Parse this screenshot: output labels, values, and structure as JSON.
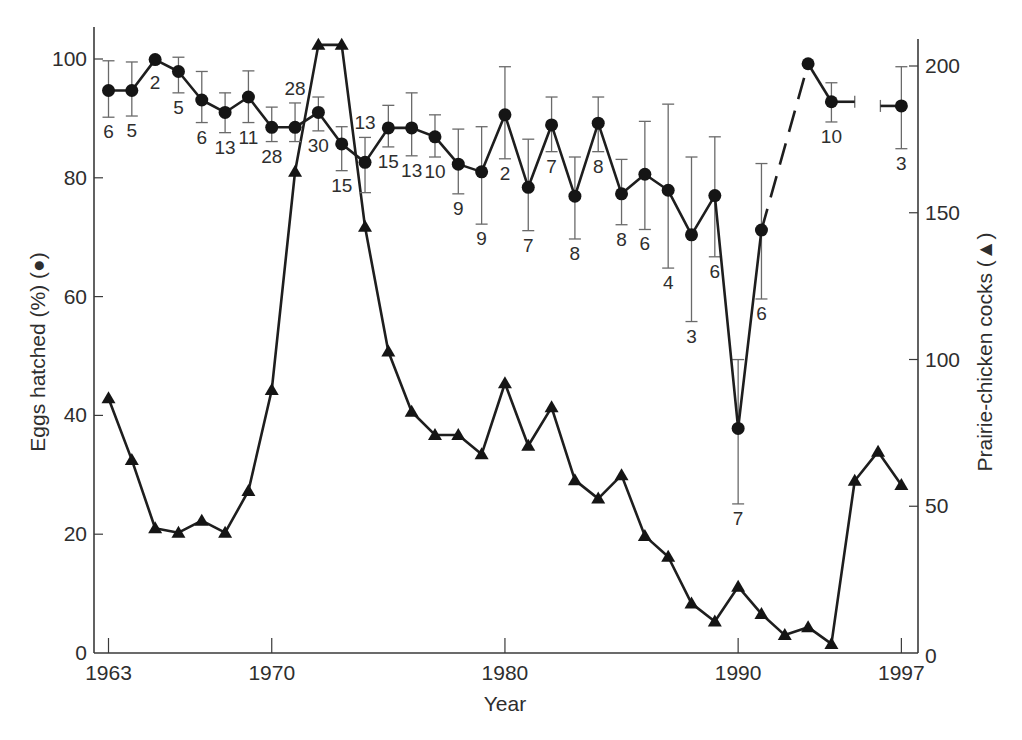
{
  "axes": {
    "xlabel": "Year",
    "ylabel_left": "Eggs hatched (%) (●)",
    "ylabel_right": "Prairie-chicken cocks (▲)"
  },
  "chart_data": {
    "type": "line",
    "title": "",
    "xlabel": "Year",
    "ylabel_left": "Eggs hatched (%) (●)",
    "ylabel_right": "Prairie-chicken cocks (▲)",
    "x_ticks": [
      1963,
      1970,
      1980,
      1990,
      1997
    ],
    "y_left_ticks": [
      0,
      20,
      40,
      60,
      80,
      100
    ],
    "y_right_ticks": [
      0,
      50,
      100,
      150,
      200
    ],
    "xlim": [
      1962.4,
      1997.7
    ],
    "ylim_left": [
      0,
      105
    ],
    "ylim_right": [
      0,
      209
    ],
    "grid": false,
    "legend": "none (markers identified in axis labels)",
    "series": [
      {
        "name": "Eggs hatched (%)",
        "marker": "circle",
        "axis": "left",
        "note": "error bars with sample size n labelled; 1992 missing (dashed connector 1991-1993)",
        "points": [
          {
            "x": 1963,
            "y": 94.7,
            "lo": 90.2,
            "hi": 99.7,
            "n": "6",
            "pos": "below"
          },
          {
            "x": 1964,
            "y": 94.7,
            "lo": 90.4,
            "hi": 99.5,
            "n": "5",
            "pos": "below"
          },
          {
            "x": 1965,
            "y": 99.9,
            "lo": null,
            "hi": null,
            "n": "2",
            "pos": "below"
          },
          {
            "x": 1966,
            "y": 97.9,
            "lo": 94.3,
            "hi": 100.3,
            "n": "5",
            "pos": "below"
          },
          {
            "x": 1967,
            "y": 93.1,
            "lo": 89.3,
            "hi": 97.9,
            "n": "6",
            "pos": "below"
          },
          {
            "x": 1968,
            "y": 91.0,
            "lo": 87.6,
            "hi": 94.3,
            "n": "13",
            "pos": "below"
          },
          {
            "x": 1969,
            "y": 93.6,
            "lo": 89.3,
            "hi": 98.0,
            "n": "11",
            "pos": "below"
          },
          {
            "x": 1970,
            "y": 88.5,
            "lo": 86.1,
            "hi": 91.9,
            "n": "28",
            "pos": "below"
          },
          {
            "x": 1971,
            "y": 88.5,
            "lo": 86.1,
            "hi": 92.6,
            "n": "28",
            "pos": "above"
          },
          {
            "x": 1972,
            "y": 91.0,
            "lo": 87.9,
            "hi": 93.6,
            "n": "30",
            "pos": "below"
          },
          {
            "x": 1973,
            "y": 85.7,
            "lo": 81.2,
            "hi": 88.6,
            "n": "15",
            "pos": "below"
          },
          {
            "x": 1974,
            "y": 82.6,
            "lo": 77.5,
            "hi": 86.8,
            "n": "13",
            "pos": "above"
          },
          {
            "x": 1975,
            "y": 88.4,
            "lo": 85.2,
            "hi": 92.2,
            "n": "15",
            "pos": "below"
          },
          {
            "x": 1976,
            "y": 88.4,
            "lo": 83.7,
            "hi": 94.3,
            "n": "13",
            "pos": "below"
          },
          {
            "x": 1977,
            "y": 86.9,
            "lo": 83.5,
            "hi": 90.6,
            "n": "10",
            "pos": "below"
          },
          {
            "x": 1978,
            "y": 82.3,
            "lo": 77.3,
            "hi": 88.2,
            "n": "9",
            "pos": "below"
          },
          {
            "x": 1979,
            "y": 81.0,
            "lo": 72.2,
            "hi": 88.6,
            "n": "9",
            "pos": "below"
          },
          {
            "x": 1980,
            "y": 90.6,
            "lo": 83.2,
            "hi": 98.7,
            "n": "2",
            "pos": "below"
          },
          {
            "x": 1981,
            "y": 78.4,
            "lo": 71.1,
            "hi": 86.5,
            "n": "7",
            "pos": "below"
          },
          {
            "x": 1982,
            "y": 88.9,
            "lo": 84.4,
            "hi": 93.6,
            "n": "7",
            "pos": "below"
          },
          {
            "x": 1983,
            "y": 76.9,
            "lo": 69.7,
            "hi": 83.5,
            "n": "8",
            "pos": "below"
          },
          {
            "x": 1984,
            "y": 89.2,
            "lo": 84.4,
            "hi": 93.6,
            "n": "8",
            "pos": "below"
          },
          {
            "x": 1985,
            "y": 77.3,
            "lo": 72.1,
            "hi": 83.1,
            "n": "8",
            "pos": "below"
          },
          {
            "x": 1986,
            "y": 80.6,
            "lo": 71.3,
            "hi": 89.5,
            "n": "6",
            "pos": "below"
          },
          {
            "x": 1987,
            "y": 77.9,
            "lo": 64.8,
            "hi": 92.4,
            "n": "4",
            "pos": "below"
          },
          {
            "x": 1988,
            "y": 70.4,
            "lo": 55.8,
            "hi": 83.5,
            "n": "3",
            "pos": "below"
          },
          {
            "x": 1989,
            "y": 77.0,
            "lo": 66.7,
            "hi": 86.9,
            "n": "6",
            "pos": "below"
          },
          {
            "x": 1990,
            "y": 37.8,
            "lo": 25.1,
            "hi": 49.4,
            "n": "7",
            "pos": "below"
          },
          {
            "x": 1991,
            "y": 71.2,
            "lo": 59.6,
            "hi": 82.4,
            "n": "6",
            "pos": "below"
          },
          {
            "x": 1993,
            "y": 99.2,
            "lo": null,
            "hi": null,
            "n": "",
            "pos": "below"
          },
          {
            "x": 1994,
            "y": 92.8,
            "lo": 89.4,
            "hi": 96.0,
            "n": "10",
            "pos": "below",
            "hbar_to": 1995.0
          },
          {
            "x": 1997,
            "y": 92.1,
            "lo": 84.9,
            "hi": 98.7,
            "n": "3",
            "pos": "below",
            "hbar_to": 1996.1
          }
        ],
        "dashed_segments": [
          [
            1991,
            1993
          ]
        ]
      },
      {
        "name": "Prairie-chicken cocks",
        "marker": "triangle",
        "axis": "right",
        "points": [
          {
            "x": 1963,
            "y": 86.8
          },
          {
            "x": 1964,
            "y": 65.8
          },
          {
            "x": 1965,
            "y": 42.5
          },
          {
            "x": 1966,
            "y": 41.0
          },
          {
            "x": 1967,
            "y": 45.1
          },
          {
            "x": 1968,
            "y": 41.0
          },
          {
            "x": 1969,
            "y": 55.2
          },
          {
            "x": 1970,
            "y": 89.6
          },
          {
            "x": 1971,
            "y": 164.0
          },
          {
            "x": 1972,
            "y": 207.2
          },
          {
            "x": 1973,
            "y": 207.2
          },
          {
            "x": 1974,
            "y": 145.2
          },
          {
            "x": 1975,
            "y": 102.7
          },
          {
            "x": 1976,
            "y": 82.2
          },
          {
            "x": 1977,
            "y": 74.3
          },
          {
            "x": 1978,
            "y": 74.3
          },
          {
            "x": 1979,
            "y": 67.7
          },
          {
            "x": 1980,
            "y": 91.9
          },
          {
            "x": 1981,
            "y": 70.6
          },
          {
            "x": 1982,
            "y": 83.7
          },
          {
            "x": 1983,
            "y": 58.9
          },
          {
            "x": 1984,
            "y": 52.6
          },
          {
            "x": 1985,
            "y": 60.6
          },
          {
            "x": 1986,
            "y": 39.9
          },
          {
            "x": 1987,
            "y": 32.8
          },
          {
            "x": 1988,
            "y": 16.9
          },
          {
            "x": 1989,
            "y": 10.7
          },
          {
            "x": 1990,
            "y": 22.6
          },
          {
            "x": 1991,
            "y": 13.3
          },
          {
            "x": 1992,
            "y": 6.1
          },
          {
            "x": 1993,
            "y": 8.8
          },
          {
            "x": 1994,
            "y": 3.1
          },
          {
            "x": 1995,
            "y": 58.7
          },
          {
            "x": 1996,
            "y": 68.6
          },
          {
            "x": 1997,
            "y": 57.2
          }
        ]
      }
    ]
  }
}
